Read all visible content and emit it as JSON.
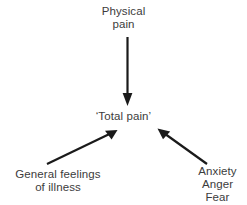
{
  "diagram": {
    "background_color": "#ffffff",
    "text_color": "#3c3c3c",
    "arrow_color": "#1a1a1a",
    "nodes": {
      "top": {
        "name": "physical-pain",
        "lines": [
          "Physical",
          "pain"
        ]
      },
      "center": {
        "name": "total-pain",
        "lines": [
          "‘Total pain’"
        ]
      },
      "bottom_left": {
        "name": "general-feelings-of-illness",
        "lines": [
          "General feelings",
          "of illness"
        ]
      },
      "bottom_right": {
        "name": "anxiety-anger-fear",
        "lines": [
          "Anxiety",
          "Anger",
          "Fear"
        ]
      }
    },
    "arrows": [
      {
        "name": "arrow-physical-pain-to-total-pain",
        "from": "physical-pain",
        "to": "total-pain",
        "direction": "down"
      },
      {
        "name": "arrow-general-feelings-to-total-pain",
        "from": "general-feelings-of-illness",
        "to": "total-pain",
        "direction": "up-right"
      },
      {
        "name": "arrow-anxiety-anger-fear-to-total-pain",
        "from": "anxiety-anger-fear",
        "to": "total-pain",
        "direction": "up-left"
      }
    ]
  }
}
